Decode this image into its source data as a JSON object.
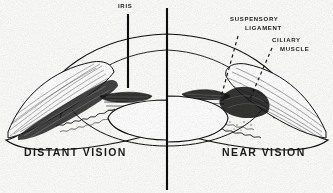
{
  "figure": {
    "background_color": "#fdfdfc",
    "ink_color": "#111111",
    "width": 333,
    "height": 193
  },
  "labels": {
    "iris": "IRIS",
    "suspensory": "SUSPENSORY",
    "ligament": "LIGAMENT",
    "ciliary": "CILIARY",
    "muscle": "MUSCLE"
  },
  "captions": {
    "left": "DISTANT VISION",
    "right": "NEAR VISION"
  },
  "annotations": [
    {
      "name": "iris-leader",
      "label": "IRIS",
      "style": "solid-vertical",
      "from_x": 128,
      "from_y": 14,
      "to_x": 128,
      "to_y": 88
    },
    {
      "name": "suspensory-ligament-leader",
      "label": "SUSPENSORY LIGAMENT",
      "style": "dashed",
      "from_x": 238,
      "from_y": 36,
      "to_x": 222,
      "to_y": 96
    },
    {
      "name": "ciliary-muscle-leader",
      "label": "CILIARY MUSCLE",
      "style": "dashed",
      "from_x": 272,
      "from_y": 48,
      "to_x": 250,
      "to_y": 100
    }
  ],
  "divider": {
    "name": "midline",
    "x": 167,
    "y_top": 8,
    "y_bottom": 190,
    "style": "solid-vertical-thick"
  },
  "halves": [
    {
      "side": "left",
      "caption": "DISTANT VISION",
      "lens_state": "flattened",
      "ciliary_muscle_state": "relaxed / stretched",
      "suspensory_ligament_state": "taut"
    },
    {
      "side": "right",
      "caption": "NEAR VISION",
      "lens_state": "rounded / thickened",
      "ciliary_muscle_state": "contracted",
      "suspensory_ligament_state": "slack"
    }
  ]
}
